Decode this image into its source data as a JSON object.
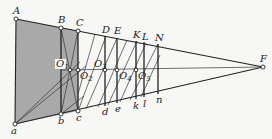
{
  "figure": {
    "colors": {
      "ink": "#222222",
      "shade": "#a9a9a9",
      "background": "#f7f7f5"
    },
    "labels": {
      "A": "A",
      "B": "B",
      "C": "C",
      "D": "D",
      "E": "E",
      "K": "K",
      "L": "L",
      "N": "N",
      "F": "F",
      "a": "a",
      "b": "b",
      "c": "c",
      "d": "d",
      "e": "e",
      "k": "k",
      "l": "l",
      "n": "n",
      "O1": "O",
      "O1_sub": "1",
      "O2": "O",
      "O2_sub": "2",
      "O3": "O",
      "O3_sub": "3",
      "O4": "O",
      "O4_sub": "4",
      "O5": "O",
      "O5_sub": "5"
    }
  }
}
